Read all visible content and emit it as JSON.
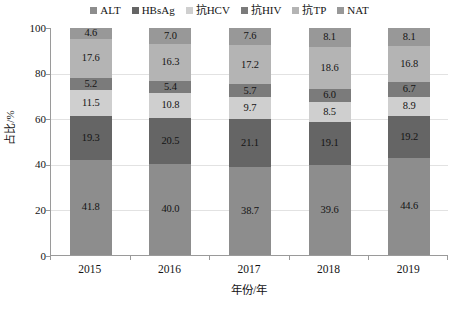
{
  "chart_data": {
    "type": "bar",
    "stacked": true,
    "orientation": "vertical",
    "title": "",
    "xlabel": "年份/年",
    "ylabel": "占比/%",
    "categories": [
      "2015",
      "2016",
      "2017",
      "2018",
      "2019"
    ],
    "ylim": [
      0,
      100
    ],
    "yticks": [
      "0",
      "20",
      "40",
      "60",
      "80",
      "100"
    ],
    "ytick_values": [
      0,
      20,
      40,
      60,
      80,
      100
    ],
    "grid": true,
    "grid_axis": "y",
    "legend_position": "top",
    "series": [
      {
        "name": "ALT",
        "color": "#8d8d8d",
        "values": [
          41.8,
          40.0,
          38.7,
          39.6,
          44.6
        ],
        "labels": [
          "41.8",
          "40.0",
          "38.7",
          "39.6",
          "44.6"
        ]
      },
      {
        "name": "HBsAg",
        "color": "#656565",
        "values": [
          19.3,
          20.5,
          21.1,
          19.1,
          19.2
        ],
        "labels": [
          "19.3",
          "20.5",
          "21.1",
          "19.1",
          "19.2"
        ]
      },
      {
        "name": "抗HCV",
        "color": "#cfcfcf",
        "values": [
          11.5,
          10.8,
          9.7,
          8.5,
          8.9
        ],
        "labels": [
          "11.5",
          "10.8",
          "9.7",
          "8.5",
          "8.9"
        ]
      },
      {
        "name": "抗HIV",
        "color": "#7b7b7b",
        "values": [
          5.2,
          5.4,
          5.7,
          6.0,
          6.7
        ],
        "labels": [
          "5.2",
          "5.4",
          "5.7",
          "6.0",
          "6.7"
        ]
      },
      {
        "name": "抗TP",
        "color": "#b4b4b4",
        "values": [
          17.6,
          16.3,
          17.2,
          18.6,
          16.8
        ],
        "labels": [
          "17.6",
          "16.3",
          "17.2",
          "18.6",
          "16.8"
        ]
      },
      {
        "name": "NAT",
        "color": "#989898",
        "values": [
          4.6,
          7.0,
          7.6,
          8.1,
          8.1
        ],
        "labels": [
          "4.6",
          "7.0",
          "7.6",
          "8.1",
          "8.1"
        ]
      }
    ]
  },
  "legend": {
    "items": [
      {
        "label": "ALT",
        "color": "#8d8d8d"
      },
      {
        "label": "HBsAg",
        "color": "#656565"
      },
      {
        "label": "抗HCV",
        "color": "#cfcfcf"
      },
      {
        "label": "抗HIV",
        "color": "#7b7b7b"
      },
      {
        "label": "抗TP",
        "color": "#b4b4b4"
      },
      {
        "label": "NAT",
        "color": "#989898"
      }
    ]
  },
  "axes": {
    "y_title": "占比/%",
    "x_title": "年份/年",
    "y_ticks": [
      "100",
      "80",
      "60",
      "40",
      "20",
      "0"
    ],
    "x_ticks": [
      "2015",
      "2016",
      "2017",
      "2018",
      "2019"
    ]
  }
}
